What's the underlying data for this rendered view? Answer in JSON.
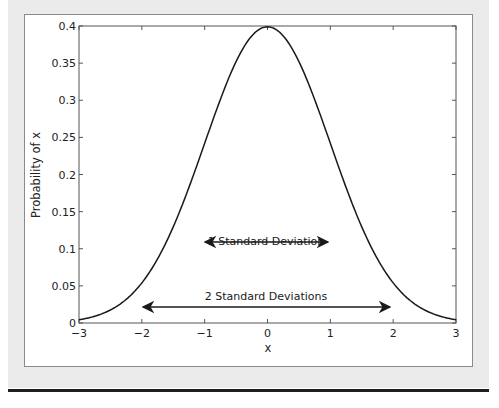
{
  "chart_data": {
    "type": "line",
    "title": "",
    "xlabel": "x",
    "ylabel": "Probability of x",
    "xlim": [
      -3,
      3
    ],
    "ylim": [
      0,
      0.4
    ],
    "grid": false,
    "legend": null,
    "x_ticks": [
      "-3",
      "-2",
      "-1",
      "0",
      "1",
      "2",
      "3"
    ],
    "y_ticks": [
      "0",
      "0.05",
      "0.1",
      "0.15",
      "0.2",
      "0.25",
      "0.3",
      "0.35",
      "0.4"
    ],
    "series": [
      {
        "name": "Standard normal PDF",
        "x": [
          -3,
          -2.5,
          -2,
          -1.5,
          -1,
          -0.5,
          0,
          0.5,
          1,
          1.5,
          2,
          2.5,
          3
        ],
        "values": [
          0.0044,
          0.0175,
          0.054,
          0.1295,
          0.242,
          0.3521,
          0.3989,
          0.3521,
          0.242,
          0.1295,
          0.054,
          0.0175,
          0.0044
        ]
      }
    ],
    "annotations": [
      {
        "text": "1 Standard Deviation",
        "arrow_from_x": -1,
        "arrow_to_x": 1,
        "arrow_y": 0.11,
        "double_headed": true
      },
      {
        "text": "2 Standard Deviations",
        "arrow_from_x": -2,
        "arrow_to_x": 2,
        "arrow_y": 0.022,
        "double_headed": true
      }
    ]
  },
  "labels": {
    "xlabel": "x",
    "ylabel": "Probability of x",
    "annot1": "1 Standard Deviation",
    "annot2": "2 Standard Deviations",
    "xt": [
      "−3",
      "−2",
      "−1",
      "0",
      "1",
      "2",
      "3"
    ],
    "yt": [
      "0",
      "0.05",
      "0.1",
      "0.15",
      "0.2",
      "0.25",
      "0.3",
      "0.35",
      "0.4"
    ]
  },
  "colors": {
    "curve": "#1a1a1a",
    "axes": "#555555",
    "background": "#ebebeb"
  }
}
